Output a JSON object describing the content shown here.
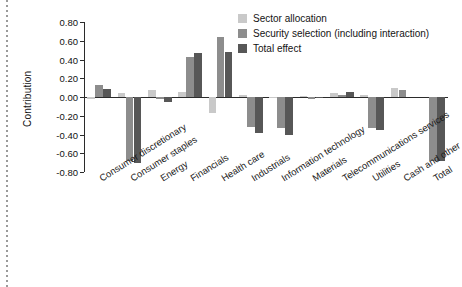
{
  "chart_data": {
    "type": "bar",
    "title": "",
    "subtitle": "",
    "xlabel": "",
    "ylabel": "Contribution",
    "ylim": [
      -0.8,
      0.8
    ],
    "yticks": [
      "0.80",
      "0.60",
      "0.40",
      "0.20",
      "0.00",
      "-0.20",
      "-0.40",
      "-0.60",
      "-0.80"
    ],
    "ytick_values": [
      0.8,
      0.6,
      0.4,
      0.2,
      0.0,
      -0.2,
      -0.4,
      -0.6,
      -0.8
    ],
    "grid": false,
    "legend_position": "top-right",
    "orientation": "vertical",
    "grouping": "clustered",
    "categories": [
      "Consumer discretionary",
      "Consumer staples",
      "Energy",
      "Financials",
      "Health care",
      "Industrials",
      "Information technology",
      "Materials",
      "Telecommunications services",
      "Utilities",
      "Cash and other",
      "Total"
    ],
    "series": [
      {
        "name": "Sector allocation",
        "color": "#c9c9c9",
        "values": [
          -0.02,
          0.04,
          0.07,
          0.05,
          -0.17,
          0.02,
          -0.01,
          0.01,
          0.04,
          0.02,
          0.1,
          0.0
        ]
      },
      {
        "name": "Security selection (including interaction)",
        "color": "#8d8d8d",
        "values": [
          0.13,
          -0.68,
          -0.02,
          0.43,
          0.64,
          -0.32,
          -0.33,
          -0.02,
          0.02,
          -0.33,
          0.07,
          -0.68
        ]
      },
      {
        "name": "Total effect",
        "color": "#575757",
        "values": [
          0.09,
          -0.7,
          -0.05,
          0.47,
          0.48,
          -0.38,
          -0.41,
          -0.01,
          0.05,
          -0.35,
          0.0,
          -0.68
        ]
      }
    ]
  },
  "legend": {
    "items": [
      {
        "label": "Sector allocation",
        "swatch": "s0"
      },
      {
        "label": "Security selection (including interaction)",
        "swatch": "s1"
      },
      {
        "label": "Total effect",
        "swatch": "s2"
      }
    ]
  }
}
